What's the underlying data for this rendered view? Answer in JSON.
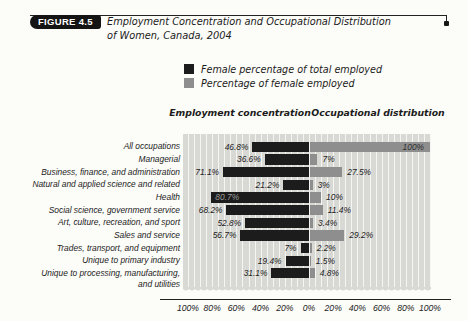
{
  "figure": {
    "badge_label": "FIGURE 4.5",
    "title_line1": "Employment Concentration and Occupational Distribution",
    "title_line2": "of Women, Canada, 2004"
  },
  "legend": {
    "items": [
      {
        "label": "Female percentage of total employed",
        "color": "#1c1c1c"
      },
      {
        "label": "Percentage of female employed",
        "color": "#8e8e8e"
      }
    ]
  },
  "chart_data": {
    "type": "bar",
    "subtype": "diverging-horizontal",
    "left_header": "Employment concentration",
    "right_header": "Occupational distribution",
    "categories": [
      "All occupations",
      "Managerial",
      "Business, finance, and administration",
      "Natural and applied science and related",
      "Health",
      "Social science, government service",
      "Art, culture, recreation, and sport",
      "Sales and service",
      "Trades, transport, and equipment",
      "Unique to primary industry",
      "Unique to processing, manufacturing,\nand utilities"
    ],
    "series": [
      {
        "name": "Female percentage of total employed",
        "side": "left",
        "color": "#1c1c1c",
        "values": [
          46.8,
          36.6,
          71.1,
          21.2,
          80.7,
          68.2,
          52.8,
          56.7,
          7,
          19.4,
          31.1
        ],
        "labels": [
          "46.8%",
          "36.6%",
          "71.1%",
          "21.2%",
          "80.7%",
          "68.2%",
          "52.8%",
          "56.7%",
          "7%",
          "19.4%",
          "31.1%"
        ]
      },
      {
        "name": "Percentage of female employed",
        "side": "right",
        "color": "#8e8e8e",
        "values": [
          100,
          7,
          27.5,
          3,
          10,
          11.4,
          3.4,
          29.2,
          2.2,
          1.5,
          4.8
        ],
        "labels": [
          "100%",
          "7%",
          "27.5%",
          "3%",
          "10%",
          "11.4%",
          "3.4%",
          "29.2%",
          "2.2%",
          "1.5%",
          "4.8%"
        ]
      }
    ],
    "x_tick_labels": [
      "100%",
      "80%",
      "60%",
      "40%",
      "20%",
      "0%",
      "20%",
      "40%",
      "60%",
      "80%",
      "100%"
    ],
    "x_tick_values": [
      -100,
      -80,
      -60,
      -40,
      -20,
      0,
      20,
      40,
      60,
      80,
      100
    ],
    "axis_range": [
      -100,
      100
    ],
    "gridline_step": 5,
    "colors": {
      "plot_bg": "#d8d8d5",
      "gridline": "#f5f5f1",
      "value_label": "#222222",
      "inside_label_on_black": "#9a9a98",
      "inside_label_on_gray": "#2e2e2e"
    }
  }
}
